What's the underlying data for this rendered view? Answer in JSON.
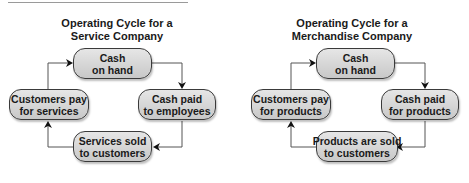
{
  "diagrams": [
    {
      "title_line1": "Operating Cycle for a",
      "title_line2": "Service Company",
      "nodes": {
        "top": {
          "line1": "Cash",
          "line2": "on hand"
        },
        "right": {
          "line1": "Cash paid",
          "line2": "to employees"
        },
        "bottom": {
          "line1": "Services sold",
          "line2": "to customers"
        },
        "left": {
          "line1": "Customers pay",
          "line2": "for services"
        }
      }
    },
    {
      "title_line1": "Operating Cycle for a",
      "title_line2": "Merchandise Company",
      "nodes": {
        "top": {
          "line1": "Cash",
          "line2": "on hand"
        },
        "right": {
          "line1": "Cash paid",
          "line2": "for products"
        },
        "bottom": {
          "line1": "Products are sold",
          "line2": "to customers"
        },
        "left": {
          "line1": "Customers pay",
          "line2": "for products"
        }
      }
    }
  ],
  "colors": {
    "node_fill_top": "#e6e6e6",
    "node_fill_bottom": "#c8c8c8",
    "node_border": "#3a3a3a",
    "connector": "#555555",
    "text": "#1a1a1a"
  }
}
